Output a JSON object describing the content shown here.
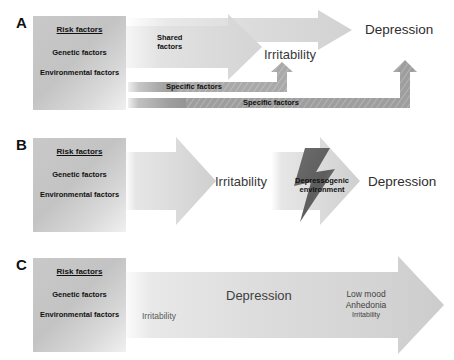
{
  "figure": {
    "background": "#ffffff"
  },
  "colors": {
    "arrow_light": "#d8d8d8",
    "arrow_mid": "#b9b9b9",
    "arrow_dark": "#8a8a8a",
    "bolt_dark": "#5a5a5a",
    "box_gray": "#c6c6c6",
    "text_dark": "#111111",
    "text_gray": "#3f3f3f"
  },
  "risk_box": {
    "title": "Risk factors",
    "items": [
      "Genetic factors",
      "Environmental factors"
    ]
  },
  "panels": [
    {
      "letter": "A",
      "risk_box": {
        "title": "Risk factors",
        "items": [
          "Genetic factors",
          "Environmental factors"
        ]
      },
      "arrows": [
        {
          "name": "shared-factors-arrow",
          "label_line1": "Shared",
          "label_line2": "factors",
          "direction": "right"
        },
        {
          "name": "risk-to-depression-arrow",
          "label": "",
          "direction": "right"
        },
        {
          "name": "specific-factors-elbow-irritability",
          "label": "Specific factors",
          "direction": "up"
        },
        {
          "name": "specific-factors-elbow-depression",
          "label": "Specific factors",
          "direction": "up"
        }
      ],
      "outcomes": [
        {
          "name": "irritability",
          "label": "Irritability"
        },
        {
          "name": "depression",
          "label": "Depression"
        }
      ]
    },
    {
      "letter": "B",
      "risk_box": {
        "title": "Risk factors",
        "items": [
          "Genetic factors",
          "Environmental factors"
        ]
      },
      "arrows": [
        {
          "name": "risk-to-irritability-arrow",
          "label": "",
          "direction": "right"
        },
        {
          "name": "irritability-to-depression-arrow",
          "label": "",
          "direction": "right"
        }
      ],
      "bolt": {
        "name": "depressogenic-environment-bolt",
        "label_line1": "Depressogenic",
        "label_line2": "environment"
      },
      "outcomes": [
        {
          "name": "irritability",
          "label": "Irritability"
        },
        {
          "name": "depression",
          "label": "Depression"
        }
      ]
    },
    {
      "letter": "C",
      "risk_box": {
        "title": "Risk factors",
        "items": [
          "Genetic factors",
          "Environmental factors"
        ]
      },
      "arrows": [
        {
          "name": "continuum-arrow",
          "label": "",
          "direction": "right"
        }
      ],
      "labels": {
        "early": "Irritability",
        "middle": "Depression",
        "symptoms": [
          "Low mood",
          "Anhedonia",
          "Irritability"
        ]
      }
    }
  ]
}
